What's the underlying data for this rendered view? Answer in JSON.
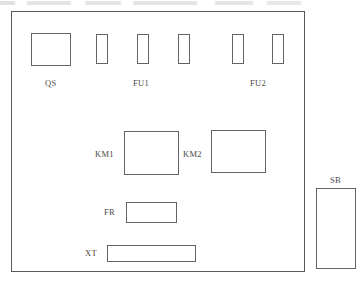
{
  "diagram": {
    "line_color": "#636363",
    "text_color": "#4a4a4a",
    "background": "#ffffff",
    "enclosure": {
      "name": "control-panel-enclosure",
      "x": 11,
      "y": 11,
      "width": 294,
      "height": 261
    },
    "components": [
      {
        "id": "QS",
        "label": "QS",
        "type": "isolator-switch",
        "shape": "rect",
        "x": 31,
        "y": 33,
        "width": 40,
        "height": 33,
        "label_x": 45,
        "label_y": 78
      },
      {
        "id": "FU1-1",
        "label": "",
        "type": "fuse",
        "shape": "rect",
        "x": 96,
        "y": 34,
        "width": 12,
        "height": 30
      },
      {
        "id": "FU1-2",
        "label": "",
        "type": "fuse",
        "shape": "rect",
        "x": 137,
        "y": 34,
        "width": 12,
        "height": 30
      },
      {
        "id": "FU1-3",
        "label": "",
        "type": "fuse",
        "shape": "rect",
        "x": 178,
        "y": 34,
        "width": 12,
        "height": 30
      },
      {
        "id": "FU2-1",
        "label": "",
        "type": "fuse",
        "shape": "rect",
        "x": 232,
        "y": 34,
        "width": 12,
        "height": 30
      },
      {
        "id": "FU2-2",
        "label": "",
        "type": "fuse",
        "shape": "rect",
        "x": 272,
        "y": 34,
        "width": 12,
        "height": 30
      },
      {
        "id": "KM1",
        "label": "KM1",
        "type": "contactor",
        "shape": "rect",
        "x": 124,
        "y": 131,
        "width": 55,
        "height": 44,
        "label_x": 95,
        "label_y": 149
      },
      {
        "id": "KM2",
        "label": "KM2",
        "type": "contactor",
        "shape": "rect",
        "x": 211,
        "y": 130,
        "width": 55,
        "height": 43,
        "label_x": 183,
        "label_y": 149
      },
      {
        "id": "FR",
        "label": "FR",
        "type": "thermal-overload-relay",
        "shape": "rect",
        "x": 126,
        "y": 202,
        "width": 51,
        "height": 21,
        "label_x": 104,
        "label_y": 207
      },
      {
        "id": "XT",
        "label": "XT",
        "type": "terminal-block",
        "shape": "rect",
        "x": 107,
        "y": 245,
        "width": 89,
        "height": 17,
        "label_x": 85,
        "label_y": 248
      },
      {
        "id": "SB",
        "label": "SB",
        "type": "push-button-station",
        "shape": "rect",
        "x": 316,
        "y": 188,
        "width": 40,
        "height": 81,
        "label_x": 330,
        "label_y": 175
      }
    ],
    "group_labels": [
      {
        "id": "FU1",
        "label": "FU1",
        "x": 133,
        "y": 78
      },
      {
        "id": "FU2",
        "label": "FU2",
        "x": 250,
        "y": 78
      }
    ]
  }
}
